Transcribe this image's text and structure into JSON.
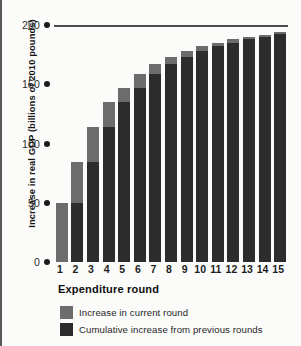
{
  "chart_data": {
    "type": "bar",
    "stacked": true,
    "title": "",
    "xlabel": "Expenditure round",
    "ylabel": "Increase in real GDP (billions of 2010 pounds)",
    "categories": [
      "1",
      "2",
      "3",
      "4",
      "5",
      "6",
      "7",
      "8",
      "9",
      "10",
      "11",
      "12",
      "13",
      "14",
      "15"
    ],
    "ylim": [
      0,
      200
    ],
    "yticks": [
      0,
      50,
      100,
      150,
      200
    ],
    "ytick_labels": [
      "0",
      "50",
      "100",
      "150",
      "200"
    ],
    "grid": false,
    "gridlines_shown": [
      200
    ],
    "legend_position": "below-axis",
    "series": [
      {
        "name": "Cumulative increase from previous rounds",
        "color": "#2c2c2c",
        "values": [
          0,
          50,
          84,
          114,
          135,
          147,
          159,
          167,
          173,
          178,
          182,
          185,
          188,
          190,
          192
        ]
      },
      {
        "name": "Increase in current round",
        "color": "#6c6c6c",
        "values": [
          50,
          34,
          30,
          21,
          12,
          12,
          8,
          6,
          5,
          4,
          3,
          3,
          2,
          2,
          2
        ]
      }
    ],
    "totals": [
      50,
      84,
      114,
      135,
      147,
      159,
      167,
      173,
      178,
      182,
      185,
      188,
      190,
      192,
      194
    ]
  },
  "axes": {
    "y_title": "Increase in real GDP (billions of 2010 pounds)",
    "x_title": "Expenditure round"
  },
  "legend": {
    "items": [
      {
        "label": "Increase in current round",
        "color": "#6c6c6c"
      },
      {
        "label": "Cumulative increase from previous rounds",
        "color": "#2c2c2c"
      }
    ]
  },
  "colors": {
    "current_round": "#6c6c6c",
    "cumulative": "#2c2c2c",
    "gridline": "#4d4d4f",
    "background": "#fbfbfa"
  }
}
